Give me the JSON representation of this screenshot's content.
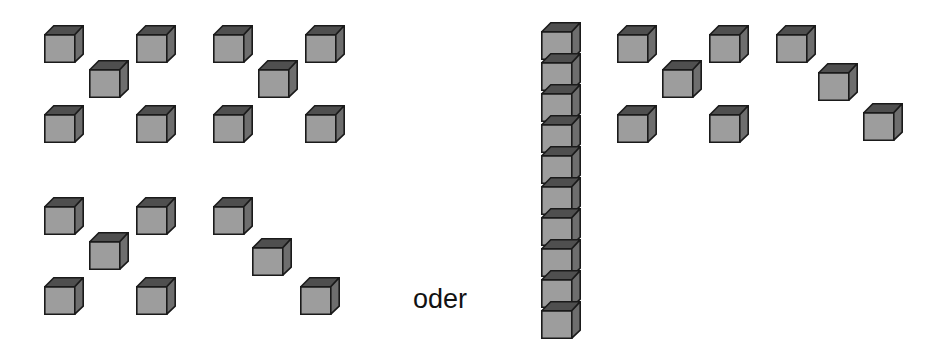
{
  "illustration": {
    "kind": "isometric-cube-diagram",
    "caption_text": "oder",
    "background_color": "#ffffff",
    "cube_style": {
      "front_face_color": "#9d9d9d",
      "top_face_color": "#4f4f4f",
      "side_face_color": "#6e6e6e",
      "outline_color": "#1a1a1a",
      "cube_width_px": 40,
      "cube_height_px": 38,
      "depth_offset_px": 9
    },
    "total_cubes_left": 18,
    "total_cubes_right": 18
  },
  "groups": [
    {
      "name": "left-quincunx-top-left",
      "label": "5",
      "pattern": "quincunx",
      "count": 5,
      "cubes": [
        {
          "x": 44,
          "y": 25
        },
        {
          "x": 136,
          "y": 25
        },
        {
          "x": 89,
          "y": 60
        },
        {
          "x": 44,
          "y": 105
        },
        {
          "x": 136,
          "y": 105
        }
      ]
    },
    {
      "name": "left-quincunx-top-right",
      "label": "5",
      "pattern": "quincunx",
      "count": 5,
      "cubes": [
        {
          "x": 213,
          "y": 25
        },
        {
          "x": 305,
          "y": 25
        },
        {
          "x": 258,
          "y": 60
        },
        {
          "x": 213,
          "y": 105
        },
        {
          "x": 305,
          "y": 105
        }
      ]
    },
    {
      "name": "left-quincunx-bottom-left",
      "label": "5",
      "pattern": "quincunx",
      "count": 5,
      "cubes": [
        {
          "x": 44,
          "y": 197
        },
        {
          "x": 136,
          "y": 197
        },
        {
          "x": 89,
          "y": 232
        },
        {
          "x": 44,
          "y": 277
        },
        {
          "x": 136,
          "y": 277
        }
      ]
    },
    {
      "name": "left-diagonal-bottom-right",
      "label": "3",
      "pattern": "diagonal",
      "count": 3,
      "cubes": [
        {
          "x": 213,
          "y": 197
        },
        {
          "x": 252,
          "y": 238
        },
        {
          "x": 300,
          "y": 277
        }
      ]
    },
    {
      "name": "right-column-of-ten",
      "label": "10",
      "pattern": "vertical-stack",
      "count": 10,
      "cubes": [
        {
          "x": 541,
          "y": 22
        },
        {
          "x": 541,
          "y": 53
        },
        {
          "x": 541,
          "y": 84
        },
        {
          "x": 541,
          "y": 115
        },
        {
          "x": 541,
          "y": 146
        },
        {
          "x": 541,
          "y": 177
        },
        {
          "x": 541,
          "y": 208
        },
        {
          "x": 541,
          "y": 239
        },
        {
          "x": 541,
          "y": 270
        },
        {
          "x": 541,
          "y": 301
        }
      ]
    },
    {
      "name": "right-quincunx",
      "label": "5",
      "pattern": "quincunx",
      "count": 5,
      "cubes": [
        {
          "x": 617,
          "y": 25
        },
        {
          "x": 709,
          "y": 25
        },
        {
          "x": 662,
          "y": 60
        },
        {
          "x": 617,
          "y": 105
        },
        {
          "x": 709,
          "y": 105
        }
      ]
    },
    {
      "name": "right-diagonal",
      "label": "3",
      "pattern": "diagonal",
      "count": 3,
      "cubes": [
        {
          "x": 776,
          "y": 25
        },
        {
          "x": 818,
          "y": 63
        },
        {
          "x": 863,
          "y": 103
        }
      ]
    }
  ],
  "caption": {
    "text": "oder",
    "x": 413,
    "y": 286
  }
}
